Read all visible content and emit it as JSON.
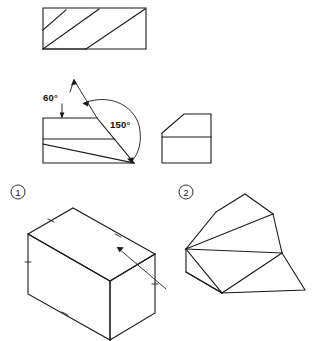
{
  "sheet": {
    "title": "Orthographic and isometric projection exercise",
    "background_color": "#ffffff",
    "line_color": "#1a1a1a",
    "width": 326,
    "height": 341
  },
  "annotations": {
    "angle_60": "60°",
    "angle_60_value": 60,
    "angle_150": "150°",
    "angle_150_value": 150,
    "item_one": "1",
    "item_two": "2"
  },
  "figures": [
    {
      "id": "fig-top-trapezoid",
      "name": "top-orthographic-view",
      "description": "Trapezoid outline with two parallel diagonal lines",
      "has_label": false
    },
    {
      "id": "fig-angled-view",
      "name": "angled-orthographic-view",
      "description": "Front view with slanted face dimensioned 60 degrees and 150 degrees",
      "has_label": true,
      "label": "1"
    },
    {
      "id": "fig-chamfer-view",
      "name": "chamfered-orthographic-view",
      "description": "Rectangle with chamfered upper-left corner and horizontal division line",
      "has_label": true,
      "label": "2"
    },
    {
      "id": "fig-iso-box",
      "name": "isometric-rectangular-block",
      "description": "Isometric rectangular block with edge tick marks and crossing construction line",
      "has_label": false
    },
    {
      "id": "fig-iso-wedge",
      "name": "isometric-wedge-solid",
      "description": "Isometric truncated wedge solid",
      "has_label": false
    }
  ]
}
